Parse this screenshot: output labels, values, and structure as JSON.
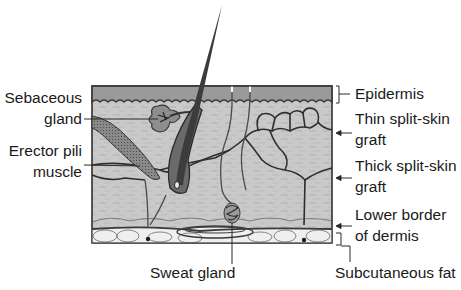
{
  "diagram": {
    "colors": {
      "epidermis": "#9a9a9a",
      "dermis": "#c9c9c9",
      "subcutaneous_fat": "#efefef",
      "outline": "#3a3a3a",
      "hair": "#3c3c3c",
      "muscle": "#7a7a7a",
      "gland": "#8e8e8e"
    },
    "labels_left": {
      "sebaceous_line1": "Sebaceous",
      "sebaceous_line2": "gland",
      "erector_line1": "Erector pili",
      "erector_line2": "muscle"
    },
    "labels_bottom": {
      "sweat_gland": "Sweat gland"
    },
    "labels_right": {
      "epidermis": "Epidermis",
      "thin_line1": "Thin split-skin",
      "thin_line2": "graft",
      "thick_line1": "Thick split-skin",
      "thick_line2": "graft",
      "lower_line1": "Lower border",
      "lower_line2": "of dermis",
      "subcutaneous": "Subcutaneous fat"
    }
  }
}
